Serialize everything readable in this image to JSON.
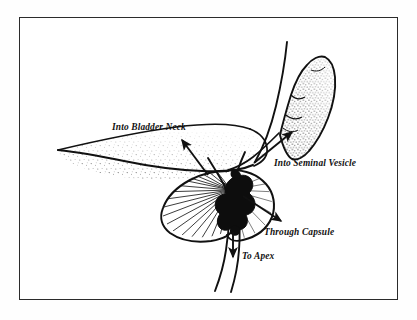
{
  "figure": {
    "background_color": "#ffffff",
    "frame_color": "#2b2b2b",
    "ink_color": "#111111"
  },
  "annotations": [
    {
      "id": "into-bladder-neck",
      "label": "Into Bladder Neck",
      "text_x": 112,
      "text_y": 130,
      "arrow_from": [
        208,
        175
      ],
      "arrow_to": [
        182,
        140
      ],
      "direction": "up-left"
    },
    {
      "id": "into-seminal-vesicle",
      "label": "Into Seminal Vesicle",
      "text_x": 274,
      "text_y": 166,
      "arrow_from": [
        254,
        163
      ],
      "arrow_to": [
        292,
        132
      ],
      "direction": "up-right"
    },
    {
      "id": "through-capsule",
      "label": "Through Capsule",
      "text_x": 264,
      "text_y": 235,
      "arrow_from": [
        243,
        196
      ],
      "arrow_to": [
        281,
        221
      ],
      "direction": "down-right"
    },
    {
      "id": "to-apex",
      "label": "To Apex",
      "text_x": 242,
      "text_y": 259,
      "arrow_from": [
        233,
        232
      ],
      "arrow_to": [
        233,
        258
      ],
      "direction": "down"
    }
  ],
  "structures": [
    {
      "id": "bladder",
      "name": "Bladder",
      "shading": "stipple"
    },
    {
      "id": "prostate",
      "name": "Prostate gland",
      "shading": "radiating-hatch"
    },
    {
      "id": "seminal-vesicle",
      "name": "Seminal vesicle",
      "shading": "stipple"
    },
    {
      "id": "vas-deferens",
      "name": "Vas deferens / ejaculatory duct",
      "shading": "line"
    },
    {
      "id": "urethra",
      "name": "Urethra",
      "shading": "line"
    },
    {
      "id": "tumor",
      "name": "Tumor mass",
      "shading": "solid-black"
    }
  ]
}
